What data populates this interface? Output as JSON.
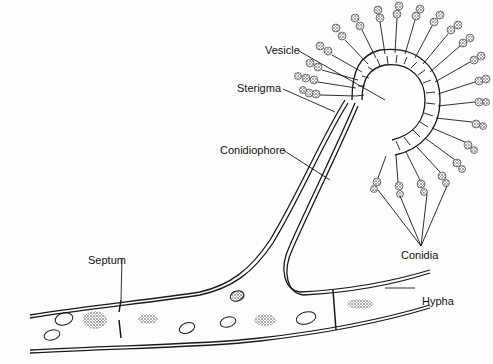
{
  "diagram": {
    "labels": {
      "vesicle": "Vesicle",
      "sterigma": "Sterigma",
      "conidiophore": "Conidiophore",
      "conidia": "Conidia",
      "septum": "Septum",
      "hypha": "Hypha"
    },
    "colors": {
      "ink": "#1a1a1a",
      "background": "#fdfdfd",
      "stipple": "#555555"
    }
  }
}
